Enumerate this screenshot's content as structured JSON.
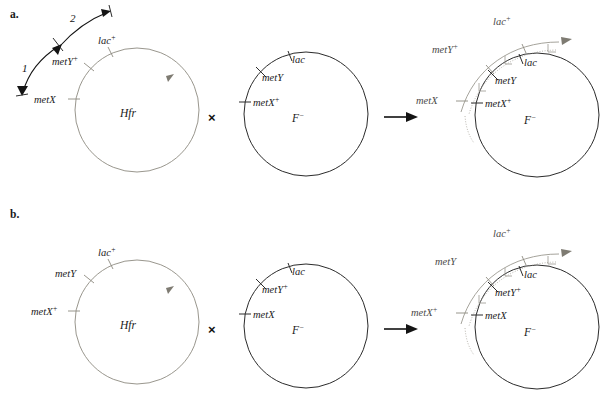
{
  "figure": {
    "background_color": "#ffffff",
    "hfr_stroke_color": "#8d8a80",
    "recipient_stroke_color": "#2b2b2b",
    "fragment_stroke_color": "#9b9890",
    "cross_symbol": "×",
    "panels": [
      {
        "id": "panel-a",
        "letter": "a.",
        "donor": {
          "name": "Hfr",
          "genes": [
            {
              "key": "lac_plus",
              "base": "lac",
              "sup": "+"
            },
            {
              "key": "metY_plus",
              "base": "metY",
              "sup": "+"
            },
            {
              "key": "metX",
              "base": "metX",
              "sup": ""
            }
          ],
          "transfer_steps": [
            {
              "label": "1"
            },
            {
              "label": "2"
            }
          ]
        },
        "recipient": {
          "name": "F−",
          "name_base": "F",
          "name_sup": "−",
          "genes": [
            {
              "key": "lac",
              "base": "lac",
              "sup": ""
            },
            {
              "key": "metY",
              "base": "metY",
              "sup": ""
            },
            {
              "key": "metX_plus",
              "base": "metX",
              "sup": "+"
            }
          ]
        },
        "result": {
          "name_base": "F",
          "name_sup": "−",
          "fragment_genes": [
            {
              "key": "lac_plus",
              "base": "lac",
              "sup": "+"
            },
            {
              "key": "metY_plus",
              "base": "metY",
              "sup": "+"
            },
            {
              "key": "metX",
              "base": "metX",
              "sup": ""
            }
          ],
          "chromosome_genes": [
            {
              "key": "lac",
              "base": "lac",
              "sup": ""
            },
            {
              "key": "metY",
              "base": "metY",
              "sup": ""
            },
            {
              "key": "metX_plus",
              "base": "metX",
              "sup": "+"
            }
          ]
        }
      },
      {
        "id": "panel-b",
        "letter": "b.",
        "donor": {
          "name": "Hfr",
          "genes": [
            {
              "key": "lac_plus",
              "base": "lac",
              "sup": "+"
            },
            {
              "key": "metY",
              "base": "metY",
              "sup": ""
            },
            {
              "key": "metX_plus",
              "base": "metX",
              "sup": "+"
            }
          ],
          "transfer_steps": []
        },
        "recipient": {
          "name_base": "F",
          "name_sup": "−",
          "genes": [
            {
              "key": "lac",
              "base": "lac",
              "sup": ""
            },
            {
              "key": "metY_plus",
              "base": "metY",
              "sup": "+"
            },
            {
              "key": "metX",
              "base": "metX",
              "sup": ""
            }
          ]
        },
        "result": {
          "name_base": "F",
          "name_sup": "−",
          "fragment_genes": [
            {
              "key": "lac_plus",
              "base": "lac",
              "sup": "+"
            },
            {
              "key": "metY",
              "base": "metY",
              "sup": ""
            },
            {
              "key": "metX_plus",
              "base": "metX",
              "sup": "+"
            }
          ],
          "chromosome_genes": [
            {
              "key": "lac",
              "base": "lac",
              "sup": ""
            },
            {
              "key": "metY_plus",
              "base": "metY",
              "sup": "+"
            },
            {
              "key": "metX",
              "base": "metX",
              "sup": ""
            }
          ]
        }
      }
    ]
  }
}
